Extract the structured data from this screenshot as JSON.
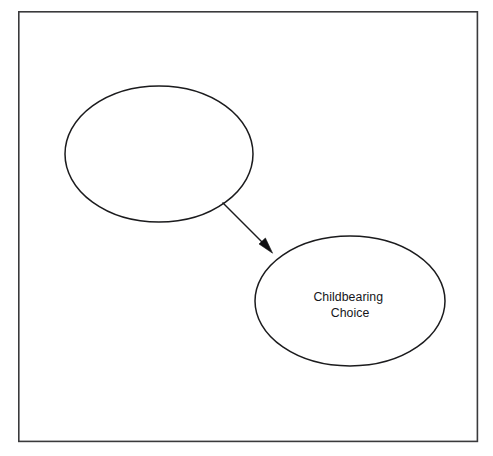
{
  "diagram": {
    "type": "concept-map",
    "background_color": "#ffffff",
    "stroke_color": "#1b1b1d",
    "frame": {
      "name": "outer-frame",
      "x": 18,
      "y": 11,
      "width": 460,
      "height": 431,
      "border_color": "#3a3a3c",
      "border_width": 1.6
    },
    "nodes": [
      {
        "id": "node-1",
        "shape": "ellipse",
        "label_lines": [],
        "label": "",
        "cx": 159,
        "cy": 154,
        "rx": 94,
        "ry": 68,
        "fill": "#ffffff",
        "stroke": "#1b1b1d"
      },
      {
        "id": "node-2",
        "shape": "ellipse",
        "label_lines": [
          "Childbearing",
          "Choice"
        ],
        "label": "Childbearing Choice",
        "line1": "Childbearing",
        "line2": "Choice",
        "cx": 350,
        "cy": 301,
        "rx": 95,
        "ry": 65,
        "fill": "#ffffff",
        "stroke": "#1b1b1d"
      }
    ],
    "edges": [
      {
        "id": "edge-1",
        "from": "node-1",
        "to": "node-2",
        "label": "",
        "arrowhead": "filled-triangle",
        "x1": 222,
        "y1": 202,
        "x2": 272,
        "y2": 252,
        "color": "#101012"
      }
    ]
  }
}
